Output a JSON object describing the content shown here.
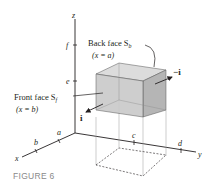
{
  "figure": {
    "caption": "FIGURE 6",
    "axes": {
      "x": "x",
      "y": "y",
      "z": "z"
    },
    "ticks": {
      "a": "a",
      "b": "b",
      "c": "c",
      "d": "d",
      "e": "e",
      "f": "f"
    },
    "labels": {
      "back_face": "Back face S",
      "back_face_sub": "b",
      "back_face_eq": "(x = a)",
      "front_face": "Front face S",
      "front_face_sub": "f",
      "front_face_eq": "(x = b)",
      "vec_i": "i",
      "vec_neg_i": "−i"
    },
    "colors": {
      "box_fill": "#c9c9c9",
      "box_side": "#b5b5b5",
      "box_top": "#dcdcdc",
      "axis": "#231f20",
      "caption": "#8a8a8a"
    }
  }
}
